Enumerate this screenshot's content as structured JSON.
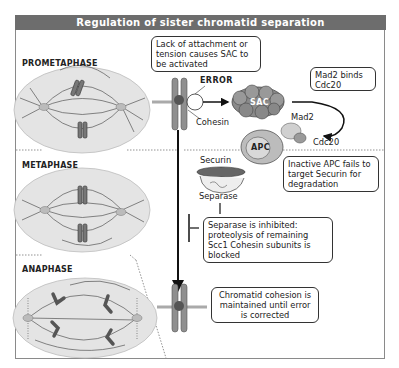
{
  "title": "Regulation of sister chromatid separation",
  "phases": [
    {
      "label": "PROMETAPHASE"
    },
    {
      "label": "METAPHASE"
    },
    {
      "label": "ANAPHASE"
    }
  ],
  "callouts": {
    "sac_activation": "Lack of attachment or tension causes SAC to be activated",
    "mad2_binds": "Mad2 binds Cdc20",
    "inactive_apc": "Inactive APC fails to target Securin for degradation",
    "separase_inhibited": "Separase is inhibited: proteolysis of remaining Scc1 Cohesin subunits is blocked",
    "cohesion_maintained": "Chromatid cohesion is maintained until error is corrected"
  },
  "labels": {
    "error": "ERROR",
    "cohesin": "Cohesin",
    "sac": "SAC",
    "mad2": "Mad2",
    "cdc20": "Cdc20",
    "apc": "APC",
    "securin": "Securin",
    "separase": "Separase"
  },
  "colors": {
    "header_bg": "#6d6d6d",
    "cell_fill": "#e4e4e4",
    "chromosome": "#8f8f8f",
    "protein_dark": "#7a7a7a",
    "protein_light": "#cfcfcf"
  }
}
